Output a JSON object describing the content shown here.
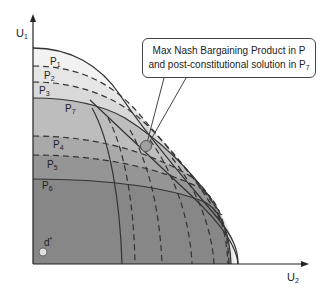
{
  "figure": {
    "axes": {
      "y_label": "U",
      "y_label_sub": "1",
      "x_label": "U",
      "x_label_sub": "2"
    },
    "regions": [
      {
        "label": "P",
        "sub": "1",
        "fill": "#f2f2f2"
      },
      {
        "label": "P",
        "sub": "2",
        "fill": "#e6e6e6"
      },
      {
        "label": "P",
        "sub": "3",
        "fill": "#d9d9d9"
      },
      {
        "label": "P",
        "sub": "7",
        "fill": "#bdbdbd"
      },
      {
        "label": "P",
        "sub": "4",
        "fill": "#a9a9a9"
      },
      {
        "label": "P",
        "sub": "5",
        "fill": "#959595"
      },
      {
        "label": "P",
        "sub": "6",
        "fill": "#878787"
      }
    ],
    "callout": {
      "line1": "Max Nash Bargaining Product in P",
      "line2_prefix": "and post-constitutional solution in P",
      "line2_sub": "7"
    },
    "disagreement_point": {
      "label": "d",
      "sup": "*"
    },
    "colors": {
      "axis": "#222222",
      "curve": "#333333",
      "point": "#a0a0a0",
      "d_point": "#e0e0e0"
    }
  }
}
